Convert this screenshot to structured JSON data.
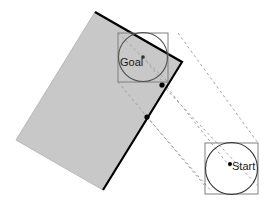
{
  "figure": {
    "type": "geometry-diagram",
    "canvas": {
      "width": 268,
      "height": 201,
      "background": "#ffffff"
    }
  },
  "colors": {
    "obstacle_fill": "#c8c8c8",
    "obstacle_stroke_dark": "#000000",
    "obstacle_stroke_light": "#b4b4b4",
    "box_stroke": "#808080",
    "circle_stroke": "#505050",
    "dashed_stroke": "#a0a0a0",
    "dot_fill": "#000000",
    "label_color": "#1a1a1a"
  },
  "obstacle": {
    "name": "obstacle-rectangle",
    "points": "95,12 16,140 103,190 182,62",
    "fill": "#c8c8c8",
    "dark_edge": "95,12 182,62",
    "dark_edge_2": "182,62 103,190"
  },
  "goal": {
    "label": "Goal",
    "label_x": 120,
    "label_y": 66,
    "box": {
      "x": 118,
      "y": 33,
      "w": 50,
      "h": 49
    },
    "circle": {
      "cx": 143,
      "cy": 57,
      "r": 24.5
    },
    "center_dot": {
      "cx": 143,
      "cy": 57,
      "r": 1.8
    }
  },
  "start": {
    "label": "Start",
    "label_x": 232,
    "label_y": 170,
    "box": {
      "x": 205,
      "y": 143,
      "w": 53,
      "h": 51
    },
    "circle": {
      "cx": 231.5,
      "cy": 168.5,
      "r": 26
    },
    "center_dot": {
      "cx": 230,
      "cy": 164,
      "r": 2.0
    }
  },
  "contact_dots": [
    {
      "name": "contact-dot-upper",
      "cx": 162,
      "cy": 85,
      "r": 2.6
    },
    {
      "name": "contact-dot-lower",
      "cx": 147,
      "cy": 117,
      "r": 2.6
    }
  ],
  "dashed_paths": [
    {
      "name": "dashed-sweep-top",
      "d": "M 178 33 L 258 143"
    },
    {
      "name": "dashed-sweep-upper",
      "d": "M 143 57 L 231 168"
    },
    {
      "name": "dashed-sweep-mid",
      "d": "M 162 85 L 258 186"
    },
    {
      "name": "dashed-sweep-lower",
      "d": "M 147 117 L 212 192"
    },
    {
      "name": "dashed-sweep-bottom",
      "d": "M 118 82 L 205 186"
    },
    {
      "name": "dashed-goal-diag",
      "d": "M 118 33 L 168 82"
    }
  ],
  "dash_pattern": "2.5,3"
}
